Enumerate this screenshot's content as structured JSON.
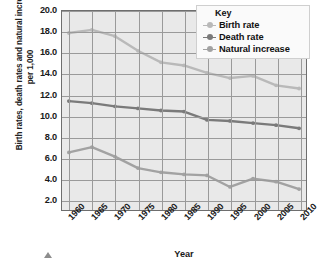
{
  "chart_data": {
    "type": "line",
    "title": "",
    "xlabel": "Year",
    "ylabel": "Birth rates, death rates and natural increase per 1,000",
    "x": [
      1960,
      1965,
      1970,
      1975,
      1980,
      1985,
      1990,
      1995,
      2000,
      2005,
      2010
    ],
    "xtick_labels": [
      "1960",
      "1965",
      "1970",
      "1975",
      "1980",
      "1985",
      "1990",
      "1995",
      "2000",
      "2005",
      "2010"
    ],
    "ytick_labels": [
      "2.0",
      "4.0",
      "6.0",
      "8.0",
      "10.0",
      "12.0",
      "14.0",
      "16.0",
      "18.0",
      "20.0"
    ],
    "yticks": [
      2.0,
      4.0,
      6.0,
      8.0,
      10.0,
      12.0,
      14.0,
      16.0,
      18.0,
      20.0
    ],
    "ylim": [
      1.0,
      20.0
    ],
    "xlim": [
      1958.5,
      2011.5
    ],
    "grid": true,
    "legend_position": "top-right",
    "legend_title": "Key",
    "series": [
      {
        "name": "Birth rate",
        "color": "#b9b9b9",
        "marker": "circle",
        "values": [
          17.9,
          18.2,
          17.6,
          16.2,
          15.1,
          14.8,
          14.1,
          13.6,
          13.8,
          12.9,
          12.6
        ]
      },
      {
        "name": "Death rate",
        "color": "#7a7a7a",
        "marker": "circle",
        "values": [
          11.4,
          11.2,
          10.9,
          10.7,
          10.5,
          10.4,
          9.6,
          9.5,
          9.3,
          9.1,
          8.8
        ]
      },
      {
        "name": "Natural increase",
        "color": "#a2a2a2",
        "marker": "circle",
        "values": [
          6.5,
          7.0,
          6.1,
          5.0,
          4.6,
          4.4,
          4.3,
          3.2,
          4.0,
          3.7,
          3.0
        ]
      }
    ]
  },
  "legend": {
    "title": "Key",
    "items": [
      {
        "label": "Birth rate"
      },
      {
        "label": "Death rate"
      },
      {
        "label": "Natural increase"
      }
    ]
  },
  "axes": {
    "x_title": "Year",
    "y_title": "Birth rates, death rates and natural increase per 1,000"
  }
}
